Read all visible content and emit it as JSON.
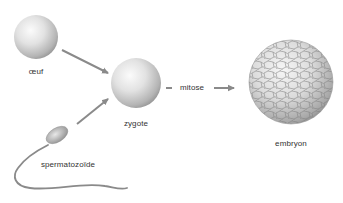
{
  "diagram": {
    "type": "process-flow",
    "topic": "fécondation et développement embryonnaire",
    "nodes": [
      {
        "id": "oeuf",
        "label": "œuf"
      },
      {
        "id": "spermatozoide",
        "label": "spermatozoïde"
      },
      {
        "id": "zygote",
        "label": "zygote"
      },
      {
        "id": "embryon",
        "label": "embryon"
      }
    ],
    "edges": [
      {
        "from": "oeuf",
        "to": "zygote",
        "label": ""
      },
      {
        "from": "spermatozoide",
        "to": "zygote",
        "label": ""
      },
      {
        "from": "zygote",
        "to": "embryon",
        "label": "mitose"
      }
    ],
    "colors": {
      "sphere_light": "#f4f4f4",
      "sphere_dark": "#9a9a9a",
      "arrow": "#8a8a8a",
      "cell_lines": "#7a7a7a",
      "text": "#333333"
    }
  }
}
